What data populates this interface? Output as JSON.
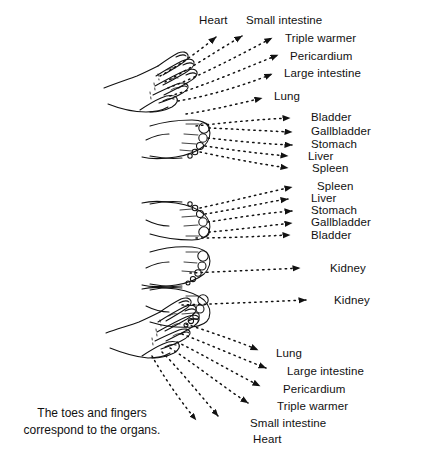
{
  "figure": {
    "title_caption": {
      "line1": "The toes and fingers",
      "line2": "correspond to the organs."
    },
    "top_hand_group": {
      "description": "left hand with fingers, dotted lines radiating to organ labels",
      "header_labels": [
        {
          "text": "Heart",
          "x": 199,
          "y": 14
        },
        {
          "text": "Small intestine",
          "x": 246,
          "y": 14
        }
      ],
      "labels": [
        {
          "text": "Triple warmer",
          "x": 285,
          "y": 32
        },
        {
          "text": "Pericardium",
          "x": 290,
          "y": 50
        },
        {
          "text": "Large intestine",
          "x": 284,
          "y": 67
        },
        {
          "text": "Lung",
          "x": 274,
          "y": 90
        }
      ]
    },
    "feet_group": {
      "description": "two feet with toes, dotted lines to organ labels",
      "labels": [
        {
          "text": "Bladder",
          "x": 311,
          "y": 116
        },
        {
          "text": "Gallbladder",
          "x": 311,
          "y": 130
        },
        {
          "text": "Stomach",
          "x": 311,
          "y": 142
        },
        {
          "text": "Liver",
          "x": 308,
          "y": 154
        },
        {
          "text": "Spleen",
          "x": 312,
          "y": 166
        },
        {
          "text": "Spleen",
          "x": 317,
          "y": 184
        },
        {
          "text": "Liver",
          "x": 311,
          "y": 196
        },
        {
          "text": "Stomach",
          "x": 311,
          "y": 208
        },
        {
          "text": "Gallbladder",
          "x": 311,
          "y": 220
        },
        {
          "text": "Bladder",
          "x": 311,
          "y": 232
        }
      ]
    },
    "kidney_group": {
      "description": "two feet showing second toe linked to kidney",
      "labels": [
        {
          "text": "Kidney",
          "x": 330,
          "y": 262
        },
        {
          "text": "Kidney",
          "x": 334,
          "y": 294
        }
      ]
    },
    "bottom_hand_group": {
      "description": "left hand with fingers, dotted lines down-right to organ labels",
      "labels": [
        {
          "text": "Lung",
          "x": 276,
          "y": 347
        },
        {
          "text": "Large intestine",
          "x": 287,
          "y": 365
        },
        {
          "text": "Pericardium",
          "x": 283,
          "y": 383
        },
        {
          "text": "Triple warmer",
          "x": 277,
          "y": 400
        },
        {
          "text": "Small intestine",
          "x": 250,
          "y": 417
        },
        {
          "text": "Heart",
          "x": 253,
          "y": 433
        }
      ]
    },
    "colors": {
      "ink": "#111111",
      "background": "#ffffff"
    }
  }
}
